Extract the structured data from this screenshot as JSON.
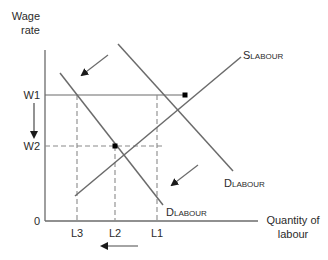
{
  "diagram": {
    "type": "supply-demand-labour-market",
    "y_axis_label_line1": "Wage",
    "y_axis_label_line2": "rate",
    "x_axis_label_line1": "Quantity of",
    "x_axis_label_line2": "labour",
    "origin_label": "0",
    "y_ticks": [
      {
        "label": "W1"
      },
      {
        "label": "W2"
      }
    ],
    "x_ticks": [
      {
        "label": "L3"
      },
      {
        "label": "L2"
      },
      {
        "label": "L1"
      }
    ],
    "curves": {
      "supply": {
        "main": "S",
        "sub": "LABOUR"
      },
      "demand_original": {
        "main": "D",
        "sub": "LABOUR"
      },
      "demand_shifted": {
        "main": "D",
        "sub": "LABOUR"
      }
    },
    "arrows": [
      {
        "name": "demand-shift-arrow-top",
        "direction": "down-left"
      },
      {
        "name": "demand-shift-arrow-bottom",
        "direction": "down-left"
      },
      {
        "name": "wage-fall-arrow",
        "direction": "down"
      },
      {
        "name": "quantity-fall-arrow",
        "direction": "left"
      }
    ],
    "colors": {
      "line": "#6b6b6b",
      "dashed": "#8a8a8a",
      "text": "#2b2b2b",
      "point": "#000000"
    }
  }
}
